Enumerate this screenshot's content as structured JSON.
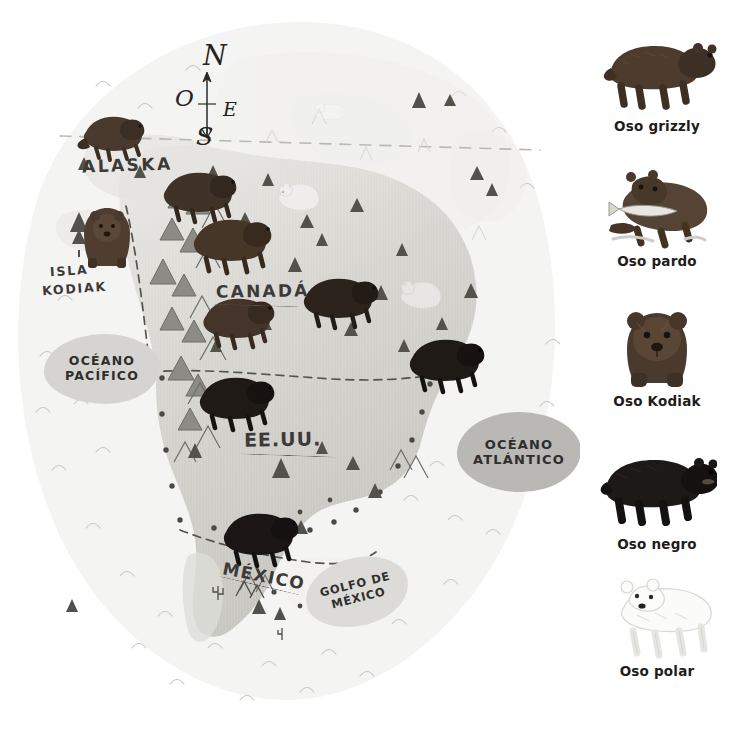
{
  "language": "es",
  "map": {
    "compass": {
      "north": "N",
      "west": "O",
      "east": "E",
      "south": "S"
    },
    "place_labels": [
      {
        "id": "alaska",
        "text": "ALASKA"
      },
      {
        "id": "isla",
        "text": "ISLA"
      },
      {
        "id": "kodiak",
        "text": "KODIAK"
      },
      {
        "id": "canada",
        "text": "CANADÁ"
      },
      {
        "id": "eeuu",
        "text": "EE.UU."
      },
      {
        "id": "mexico",
        "text": "MÉXICO"
      }
    ],
    "water_labels": [
      {
        "id": "pacifico",
        "line1": "OCÉANO",
        "line2": "PACÍFICO"
      },
      {
        "id": "atlantico",
        "line1": "OCÉANO",
        "line2": "ATLÁNTICO"
      },
      {
        "id": "golfo",
        "line1": "GOLFO DE",
        "line2": "MÉXICO"
      }
    ],
    "colors": {
      "paper": "#ffffff",
      "ocean_blob": "#f2f2f0",
      "land_light": "#e3e2dd",
      "land_mid": "#cfcec9",
      "land_dark": "#b8b7b2",
      "ink": "#3b3a38",
      "border_dash": "#5f5d58",
      "pacifico_blob": "#d5d4d0",
      "atlantico_blob": "#b9b8b4",
      "golfo_blob": "#dcdbd7",
      "bear_brown": "#4a3a2e",
      "bear_dark": "#2b2522",
      "bear_black": "#1a1715",
      "polar_bear": "#fbfbfa"
    },
    "bears_on_map": [
      {
        "species": "grizzly",
        "region": "Alaska norte",
        "x": 112,
        "y": 130
      },
      {
        "species": "kodiak",
        "region": "Isla Kodiak",
        "x": 100,
        "y": 240
      },
      {
        "species": "grizzly",
        "region": "Canadá oeste",
        "x": 192,
        "y": 195
      },
      {
        "species": "pardo",
        "region": "Canadá centro",
        "x": 222,
        "y": 240
      },
      {
        "species": "pardo",
        "region": "Canadá sur",
        "x": 236,
        "y": 318
      },
      {
        "species": "negro",
        "region": "Canadá este",
        "x": 336,
        "y": 296
      },
      {
        "species": "negro",
        "region": "EE.UU. oeste",
        "x": 232,
        "y": 398
      },
      {
        "species": "negro",
        "region": "EE.UU. este",
        "x": 442,
        "y": 360
      },
      {
        "species": "negro",
        "region": "México",
        "x": 258,
        "y": 535
      },
      {
        "species": "polar",
        "region": "Ártico oeste",
        "x": 298,
        "y": 190
      },
      {
        "species": "polar",
        "region": "Ártico centro",
        "x": 416,
        "y": 288
      }
    ]
  },
  "legend": {
    "items": [
      {
        "id": "grizzly",
        "label": "Oso grizzly",
        "art": "bear-grizzly-side",
        "tone": "#4d3b2e"
      },
      {
        "id": "pardo",
        "label": "Oso pardo",
        "art": "bear-brown-fishing",
        "tone": "#554436"
      },
      {
        "id": "kodiak",
        "label": "Oso Kodiak",
        "art": "bear-kodiak-front",
        "tone": "#4a3a2d"
      },
      {
        "id": "negro",
        "label": "Oso negro",
        "art": "bear-black-side",
        "tone": "#1c1917"
      },
      {
        "id": "polar",
        "label": "Oso polar",
        "art": "bear-polar-side",
        "tone": "#f7f7f6"
      }
    ]
  }
}
